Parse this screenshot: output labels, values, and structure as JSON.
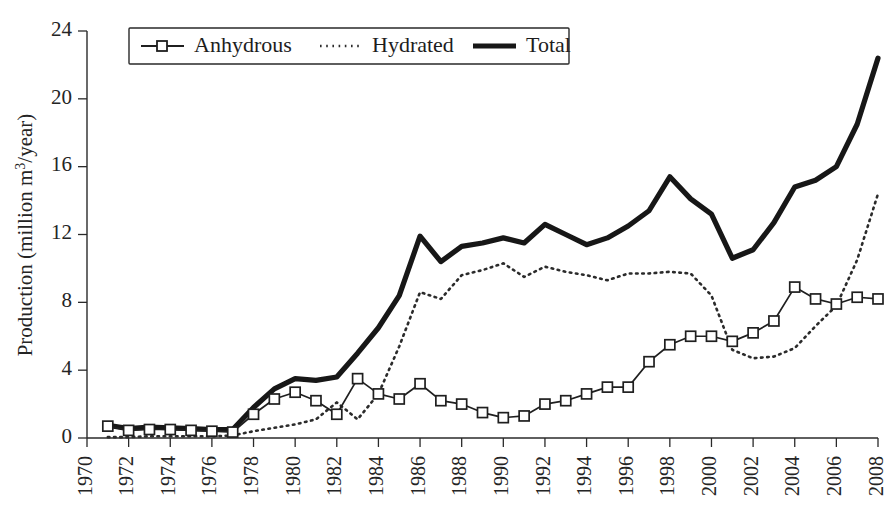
{
  "chart_data": {
    "type": "line",
    "title": "",
    "xlabel": "",
    "ylabel": "Production (million m³/year)",
    "ylabel_parts": {
      "prefix": "Production (million m",
      "sup": "3",
      "suffix": "/year)"
    },
    "xlim": [
      1970,
      2008
    ],
    "ylim": [
      0,
      24
    ],
    "yticks": [
      0,
      4,
      8,
      12,
      16,
      20,
      24
    ],
    "xticks": [
      1970,
      1972,
      1974,
      1976,
      1978,
      1980,
      1982,
      1984,
      1986,
      1988,
      1990,
      1992,
      1994,
      1996,
      1998,
      2000,
      2002,
      2004,
      2006,
      2008
    ],
    "xtick_labels": [
      "1970",
      "1972",
      "1974",
      "1976",
      "1978",
      "1980",
      "1982",
      "1984",
      "1986",
      "1988",
      "1990",
      "1992",
      "1994",
      "1996",
      "1998",
      "2000",
      "2002",
      "2004",
      "2006",
      "2008"
    ],
    "ytick_labels": [
      "0",
      "4",
      "8",
      "12",
      "16",
      "20",
      "24"
    ],
    "grid": false,
    "legend_position": "top-left",
    "x": [
      1971,
      1972,
      1973,
      1974,
      1975,
      1976,
      1977,
      1978,
      1979,
      1980,
      1981,
      1982,
      1983,
      1984,
      1985,
      1986,
      1987,
      1988,
      1989,
      1990,
      1991,
      1992,
      1993,
      1994,
      1995,
      1996,
      1997,
      1998,
      1999,
      2000,
      2001,
      2002,
      2003,
      2004,
      2005,
      2006,
      2007,
      2008
    ],
    "series": [
      {
        "name": "Anhydrous",
        "style": "line-marker-square",
        "values": [
          0.7,
          0.45,
          0.5,
          0.5,
          0.45,
          0.4,
          0.35,
          1.4,
          2.3,
          2.7,
          2.2,
          1.4,
          3.5,
          2.6,
          2.3,
          3.2,
          2.2,
          2.0,
          1.5,
          1.2,
          1.3,
          2.0,
          2.2,
          2.6,
          3.0,
          3.0,
          4.5,
          5.5,
          6.0,
          6.0,
          5.7,
          6.2,
          6.9,
          8.9,
          8.2,
          7.9,
          8.3,
          8.2
        ]
      },
      {
        "name": "Hydrated",
        "style": "dotted",
        "values": [
          0.05,
          0.05,
          0.1,
          0.1,
          0.1,
          0.1,
          0.15,
          0.4,
          0.6,
          0.8,
          1.1,
          2.1,
          1.1,
          2.6,
          5.4,
          8.6,
          8.2,
          9.6,
          9.9,
          10.3,
          9.5,
          10.1,
          9.8,
          9.6,
          9.3,
          9.7,
          9.7,
          9.8,
          9.7,
          8.4,
          5.2,
          4.7,
          4.8,
          5.3,
          6.6,
          7.8,
          10.5,
          14.4
        ]
      },
      {
        "name": "Total",
        "style": "thick-solid",
        "values": [
          0.75,
          0.55,
          0.65,
          0.6,
          0.55,
          0.5,
          0.5,
          1.8,
          2.9,
          3.5,
          3.4,
          3.6,
          5.0,
          6.5,
          8.4,
          11.9,
          10.4,
          11.3,
          11.5,
          11.8,
          11.5,
          12.6,
          12.0,
          11.4,
          11.8,
          12.5,
          13.4,
          15.4,
          14.1,
          13.2,
          10.6,
          11.1,
          12.7,
          14.8,
          15.2,
          16.0,
          18.5,
          22.4
        ]
      }
    ],
    "legend": [
      {
        "label": "Anhydrous",
        "marker": "line-with-square-marker"
      },
      {
        "label": "Hydrated",
        "marker": "dotted-line"
      },
      {
        "label": "Total",
        "marker": "thick-solid-line"
      }
    ],
    "colors": {
      "ink": "#1b1b1b",
      "background": "#ffffff"
    }
  }
}
